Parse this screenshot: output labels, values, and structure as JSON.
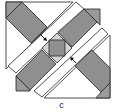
{
  "figure": {
    "caption": "c",
    "colors": {
      "background": "#ffffff",
      "fabric_dark": "#8f8f8f",
      "fabric_corner": "#9a9a9a",
      "fabric_light": "#d4d4d4",
      "outline": "#222222"
    },
    "annotations": [
      {
        "type": "arrow",
        "direction": "down-right",
        "target": "center-square"
      },
      {
        "type": "arrow",
        "direction": "up-left",
        "target": "center-square"
      }
    ]
  }
}
